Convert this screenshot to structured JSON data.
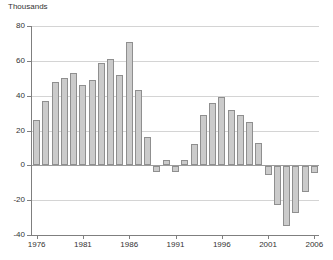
{
  "chart_data": {
    "type": "bar",
    "title": "Thousands",
    "xlabel": "",
    "ylabel": "Thousands",
    "x": [
      1976,
      1977,
      1978,
      1979,
      1980,
      1981,
      1982,
      1983,
      1984,
      1985,
      1986,
      1987,
      1988,
      1989,
      1990,
      1991,
      1992,
      1993,
      1994,
      1995,
      1996,
      1997,
      1998,
      1999,
      2000,
      2001,
      2002,
      2003,
      2004,
      2005,
      2006
    ],
    "values": [
      26,
      37,
      48,
      50,
      53,
      46,
      49,
      59,
      61,
      52,
      71,
      43,
      16,
      -3,
      3,
      -3,
      3,
      12,
      29,
      36,
      39,
      32,
      29,
      25,
      13,
      -5,
      -22,
      -34,
      -27,
      -15,
      -4
    ],
    "ylim": [
      -40,
      80
    ],
    "yticks": [
      80,
      60,
      40,
      20,
      0,
      -20,
      -40
    ],
    "xticks": [
      1976,
      1981,
      1986,
      1991,
      1996,
      2001,
      2006
    ],
    "grid": true,
    "legend": false,
    "colors": {
      "bar_fill": "#cbcbcb",
      "bar_border": "#8f8f8f",
      "grid": "#d4d4d4",
      "zero_line": "#9c9c9c",
      "axis": "#7f7f7f",
      "text": "#333333",
      "background": "#ffffff"
    }
  }
}
